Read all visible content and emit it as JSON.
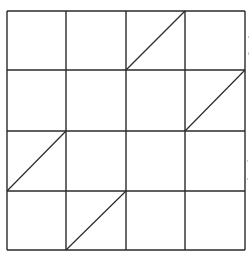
{
  "figure": {
    "rows": 4,
    "cols": 4,
    "stroke_color": "#2a2a2a",
    "background_color": "#ffffff",
    "grid": {
      "x_lines": [
        7,
        66,
        126,
        185,
        245
      ],
      "y_lines": [
        11,
        70,
        131,
        191,
        250
      ]
    },
    "diagonals": [
      {
        "row": 1,
        "col": 3,
        "direction": "bottom-left-to-top-right",
        "x1": 126,
        "y1": 70,
        "x2": 185,
        "y2": 11
      },
      {
        "row": 2,
        "col": 4,
        "direction": "bottom-left-to-top-right",
        "x1": 185,
        "y1": 131,
        "x2": 245,
        "y2": 70
      },
      {
        "row": 3,
        "col": 1,
        "direction": "bottom-left-to-top-right",
        "x1": 7,
        "y1": 191,
        "x2": 66,
        "y2": 131
      },
      {
        "row": 4,
        "col": 2,
        "direction": "bottom-left-to-top-right",
        "x1": 66,
        "y1": 250,
        "x2": 126,
        "y2": 191
      }
    ]
  }
}
